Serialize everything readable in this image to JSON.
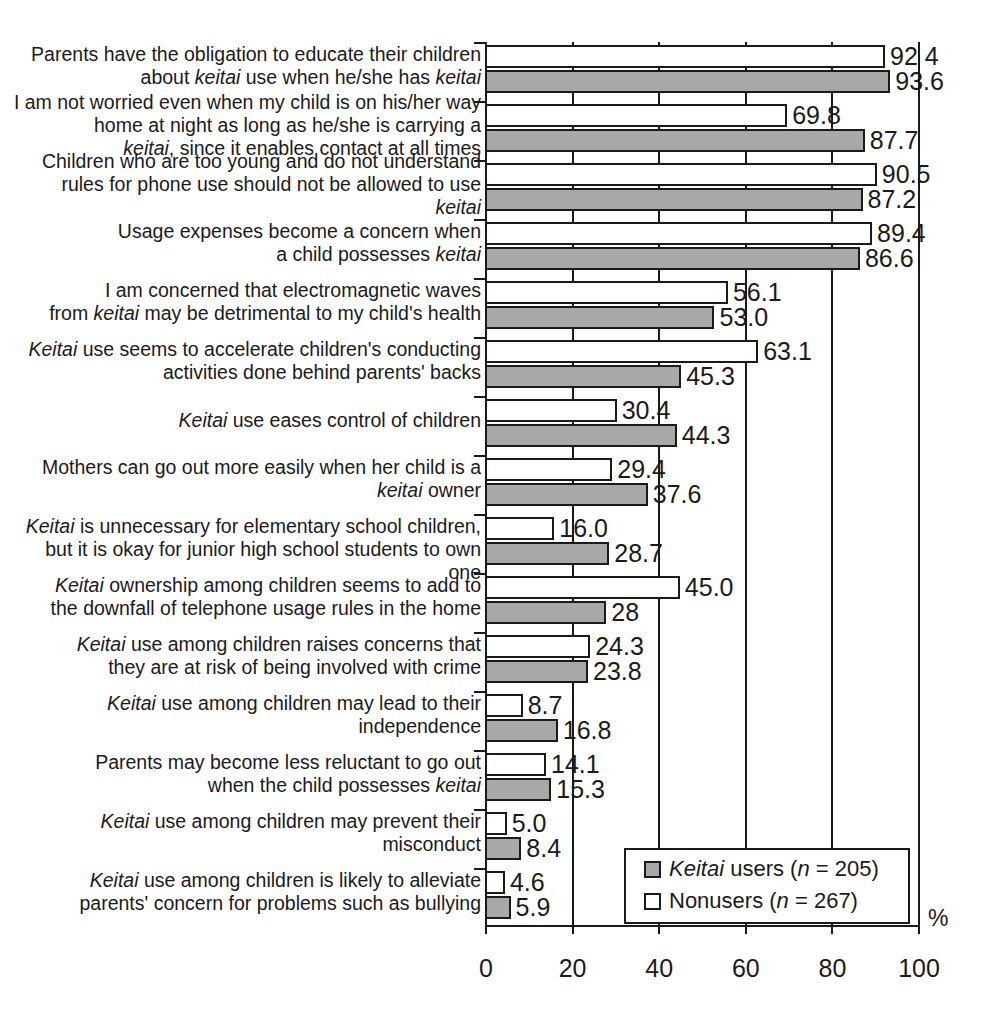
{
  "chart_data": {
    "type": "bar",
    "orientation": "horizontal",
    "title": "",
    "xlabel": "%",
    "ylabel": "",
    "xlim": [
      0,
      100
    ],
    "xticks": [
      "0",
      "20",
      "40",
      "60",
      "80",
      "100"
    ],
    "grid": true,
    "legend_position": "bottom-right",
    "colors": {
      "users": "#a8a8a8",
      "nonusers": "#ffffff",
      "outline": "#1a1a1a"
    },
    "legend": [
      {
        "key": "users",
        "label_italic": "Keitai",
        "label_rest": " users (",
        "n_italic": "n",
        "n_rest": " = 205)"
      },
      {
        "key": "nonusers",
        "label_italic": "",
        "label_rest": "Nonusers (",
        "n_italic": "n",
        "n_rest": " = 267)"
      }
    ],
    "series": [
      {
        "name": "Keitai users (n = 205)",
        "key": "users",
        "values": [
          93.6,
          87.7,
          87.2,
          86.6,
          53.0,
          45.3,
          44.3,
          37.6,
          28.7,
          28,
          23.8,
          16.8,
          15.3,
          8.4,
          5.9
        ],
        "value_labels": [
          "93.6",
          "87.7",
          "87.2",
          "86.6",
          "53.0",
          "45.3",
          "44.3",
          "37.6",
          "28.7",
          "28",
          "23.8",
          "16.8",
          "15.3",
          "8.4",
          "5.9"
        ]
      },
      {
        "name": "Nonusers (n = 267)",
        "key": "nonusers",
        "values": [
          92.4,
          69.8,
          90.5,
          89.4,
          56.1,
          63.1,
          30.4,
          29.4,
          16.0,
          45.0,
          24.3,
          8.7,
          14.1,
          5.0,
          4.6
        ],
        "value_labels": [
          "92 4",
          "69.8",
          "90.5",
          "89.4",
          "56.1",
          "63.1",
          "30.4",
          "29.4",
          "16.0",
          "45.0",
          "24.3",
          "8.7",
          "14.1",
          "5.0",
          "4.6"
        ]
      }
    ],
    "categories": [
      "Parents have the obligation to educate their children\nabout |keitai| use when he/she has |keitai|",
      "I am not worried even when my child is on his/her way\nhome at night as long as he/she is carrying a\n|keitai|, since it enables contact at all times",
      "Children who are too young and do not understand\nrules for phone use should not be allowed to use\n|keitai|",
      "Usage expenses become a concern when\na child possesses |keitai|",
      "I am concerned that electromagnetic waves\nfrom |keitai| may be detrimental to my child's health",
      "|Keitai| use seems to accelerate children's conducting\nactivities done behind  parents' backs",
      "|Keitai| use eases control of children",
      "Mothers can go out more easily when her child is a\n|keitai| owner",
      "|Keitai| is unnecessary for elementary school children,\nbut it is okay for junior high school students to own one",
      "|Keitai| ownership among children seems to add to\nthe downfall of telephone usage rules in the home",
      "|Keitai| use among children raises concerns that\nthey are at risk of being involved with crime",
      "|Keitai| use among children may lead to their\nindependence",
      "Parents may become less reluctant to go out\nwhen the child possesses |keitai|",
      "|Keitai| use among children may prevent their\nmisconduct",
      "|Keitai| use among children is likely to alleviate\nparents' concern for problems such as bullying"
    ]
  }
}
